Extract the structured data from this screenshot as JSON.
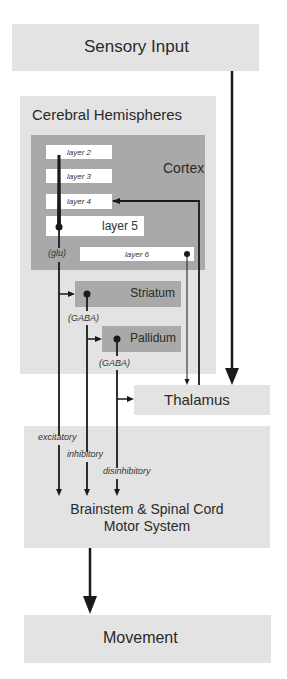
{
  "nodes": {
    "sensory_input": "Sensory Input",
    "cerebral_hemispheres": "Cerebral Hemispheres",
    "cortex": "Cortex",
    "layers": [
      "layer 2",
      "layer 3",
      "layer 4",
      "layer 5",
      "layer 6"
    ],
    "striatum": "Striatum",
    "pallidum": "Pallidum",
    "thalamus": "Thalamus",
    "brainstem_line1": "Brainstem & Spinal Cord",
    "brainstem_line2": "Motor System",
    "movement": "Movement"
  },
  "neurotransmitters": {
    "cortex": "(glu)",
    "striatum": "(GABA)",
    "pallidum": "(GABA)"
  },
  "pathways": {
    "excitatory": "excitatory",
    "inhibitory": "inhibitory",
    "disinhibitory": "disinhibitory"
  },
  "colors": {
    "light_box": "#e3e3e3",
    "dark_box": "#a9a9a9",
    "line": "#1a1a1a"
  }
}
